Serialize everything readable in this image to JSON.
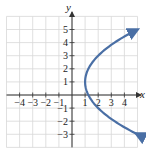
{
  "chart_data": {
    "type": "line",
    "title": "",
    "xlabel": "x",
    "ylabel": "y",
    "xlim": [
      -5,
      5
    ],
    "ylim": [
      -4,
      6
    ],
    "grid": true,
    "x_ticks": [
      -4,
      -3,
      -2,
      -1,
      1,
      2,
      3,
      4
    ],
    "x_tick_labels": [
      "−4",
      "−3",
      "−2",
      "−1",
      "1",
      "2",
      "3",
      "4"
    ],
    "y_ticks": [
      5,
      4,
      3,
      2,
      1,
      -1,
      -2,
      -3
    ],
    "y_tick_labels": [
      "5",
      "4",
      "3",
      "2",
      "1",
      "−1",
      "−2",
      "−3"
    ],
    "series": [
      {
        "name": "x = (1/4)(y − 1)² + 1",
        "description": "Rightward-opening parabola, vertex (1, 1), arrows at both ends",
        "vertex": [
          1,
          1
        ],
        "points": [
          [
            5,
            -3
          ],
          [
            3.25,
            -2
          ],
          [
            2,
            -1
          ],
          [
            1.25,
            0
          ],
          [
            1,
            1
          ],
          [
            1.25,
            2
          ],
          [
            2,
            3
          ],
          [
            3.25,
            4
          ],
          [
            4.9,
            5
          ]
        ],
        "color": "#4a6fa5"
      }
    ]
  },
  "colors": {
    "curve": "#4a6fa5",
    "grid": "#d8d8d8",
    "axis": "#333333"
  }
}
